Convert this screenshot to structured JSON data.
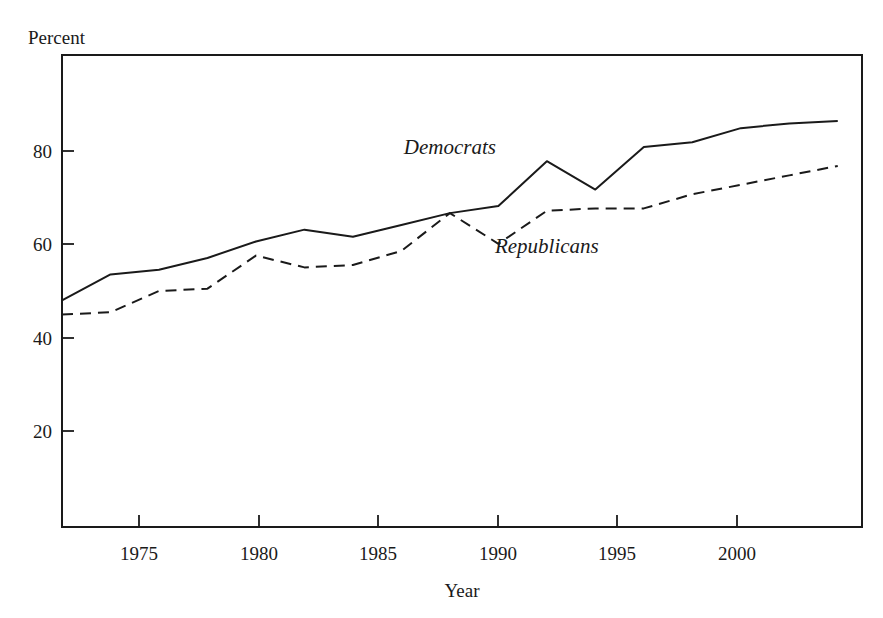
{
  "chart_data": {
    "type": "line",
    "title": "",
    "xlabel": "Year",
    "ylabel": "Percent",
    "xlim": [
      1972,
      2005
    ],
    "ylim": [
      0,
      100
    ],
    "xticks": [
      1975,
      1980,
      1985,
      1990,
      1995,
      2000
    ],
    "xtick_labels": [
      "1975",
      "1980",
      "1985",
      "1990",
      "1995",
      "2000"
    ],
    "yticks": [
      20,
      40,
      60,
      80
    ],
    "ytick_labels": [
      "20",
      "40",
      "60",
      "80"
    ],
    "grid": false,
    "legend_position": "inline-annotation",
    "series": [
      {
        "name": "Democrats",
        "style": "solid",
        "x": [
          1972,
          1974,
          1976,
          1978,
          1980,
          1982,
          1984,
          1986,
          1988,
          1990,
          1992,
          1994,
          1996,
          1998,
          2000,
          2002,
          2004
        ],
        "values": [
          48,
          53.5,
          54.5,
          57,
          60.5,
          63,
          61.5,
          64,
          66.5,
          68,
          77.5,
          71.5,
          80.5,
          81.5,
          84.5,
          85.5,
          86
        ]
      },
      {
        "name": "Republicans",
        "style": "dashed",
        "x": [
          1972,
          1974,
          1976,
          1978,
          1980,
          1982,
          1984,
          1986,
          1988,
          1990,
          1992,
          1994,
          1996,
          1998,
          2000,
          2002,
          2004
        ],
        "values": [
          45,
          45.5,
          50,
          50.5,
          57.5,
          55,
          55.5,
          58.5,
          66.5,
          60,
          67,
          67.5,
          67.5,
          70.5,
          72.5,
          74.5,
          76.5
        ]
      }
    ],
    "annotations": [
      {
        "text": "Democrats",
        "x": 1988,
        "y": 79
      },
      {
        "text": "Republicans",
        "x": 1992,
        "y": 58
      }
    ]
  }
}
